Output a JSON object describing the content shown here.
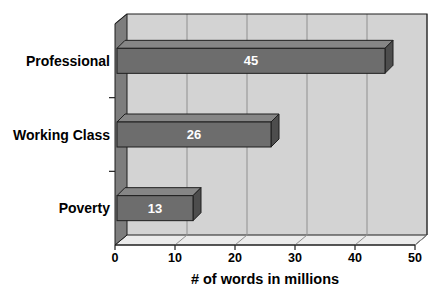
{
  "chart_data": {
    "type": "bar",
    "orientation": "horizontal",
    "style": "3d",
    "title": "",
    "categories": [
      "Professional",
      "Working Class",
      "Poverty"
    ],
    "values": [
      45,
      26,
      13
    ],
    "data_labels": [
      "45",
      "26",
      "13"
    ],
    "xlabel": "# of words in millions",
    "ylabel": "",
    "xlim": [
      0,
      50
    ],
    "xticks": [
      "0",
      "10",
      "20",
      "30",
      "40",
      "50"
    ],
    "grid": true,
    "legend": false,
    "colors": {
      "background": "#ffffff",
      "back_wall": "#d3d3d3",
      "side_wall": "#7d7d7d",
      "floor": "#ebebeb",
      "gridline": "#8f8f8f",
      "outline": "#1f1f1f",
      "bar_front": "#6d6d6d",
      "bar_top": "#868686",
      "bar_end": "#4d4d4d",
      "category_text": "#000000",
      "value_text": "#ffffff"
    }
  }
}
